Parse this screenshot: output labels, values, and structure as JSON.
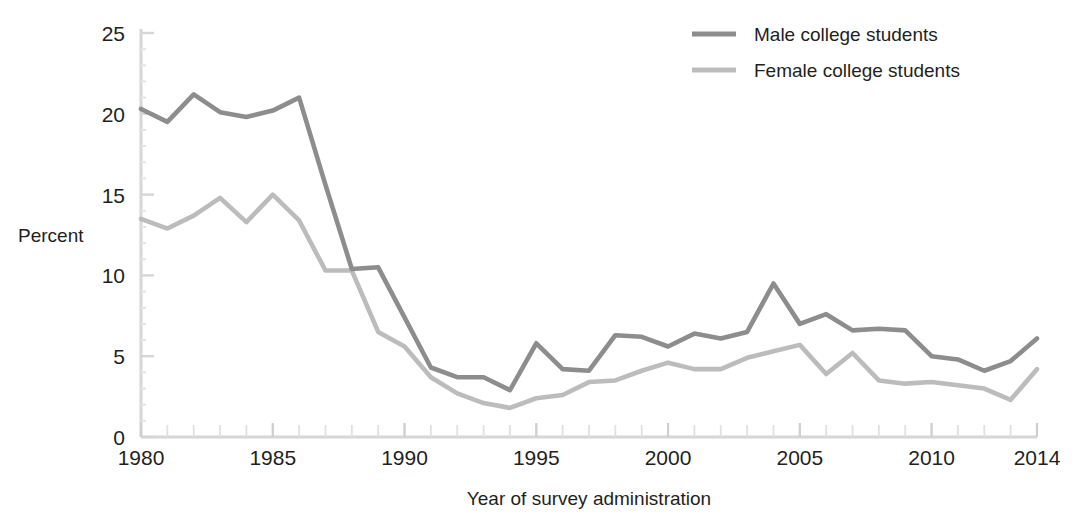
{
  "chart_data": {
    "type": "line",
    "title": "",
    "xlabel": "Year of survey administration",
    "ylabel": "Percent",
    "xlim": [
      1980,
      2014
    ],
    "ylim": [
      0,
      25
    ],
    "yticks": [
      0,
      5,
      10,
      15,
      20,
      25
    ],
    "ytick_labels": [
      "0",
      "5",
      "10",
      "15",
      "20",
      "25"
    ],
    "xticks": [
      1980,
      1985,
      1990,
      1995,
      2000,
      2005,
      2010,
      2014
    ],
    "xtick_labels": [
      "1980",
      "1985",
      "1990",
      "1995",
      "2000",
      "2005",
      "2010",
      "2014"
    ],
    "minor_xticks_every": 1,
    "grid": false,
    "legend_position": "top-right",
    "x": [
      1980,
      1981,
      1982,
      1983,
      1984,
      1985,
      1986,
      1987,
      1988,
      1989,
      1990,
      1991,
      1992,
      1993,
      1994,
      1995,
      1996,
      1997,
      1998,
      1999,
      2000,
      2001,
      2002,
      2003,
      2004,
      2005,
      2006,
      2007,
      2008,
      2009,
      2010,
      2011,
      2012,
      2013,
      2014
    ],
    "series": [
      {
        "name": "Male college students",
        "color": "#8d8d8d",
        "values": [
          20.3,
          19.5,
          21.2,
          20.1,
          19.8,
          20.2,
          21.0,
          15.6,
          10.4,
          10.5,
          7.4,
          4.3,
          3.7,
          3.7,
          2.9,
          5.8,
          4.2,
          4.1,
          6.3,
          6.2,
          5.6,
          6.4,
          6.1,
          6.5,
          9.5,
          7.0,
          7.6,
          6.6,
          6.7,
          6.6,
          5.0,
          4.8,
          4.1,
          4.7,
          6.1
        ]
      },
      {
        "name": "Female college students",
        "color": "#bcbcbc",
        "values": [
          13.5,
          12.9,
          13.7,
          14.8,
          13.3,
          15.0,
          13.4,
          10.3,
          10.3,
          6.5,
          5.6,
          3.7,
          2.7,
          2.1,
          1.8,
          2.4,
          2.6,
          3.4,
          3.5,
          4.1,
          4.6,
          4.2,
          4.2,
          4.9,
          5.3,
          5.7,
          3.9,
          5.2,
          3.5,
          3.3,
          3.4,
          3.2,
          3.0,
          2.3,
          4.2
        ]
      }
    ]
  },
  "legend": {
    "items": [
      {
        "label": "Male college students",
        "color": "#8d8d8d"
      },
      {
        "label": "Female college students",
        "color": "#bcbcbc"
      }
    ]
  },
  "axes": {
    "y_title": "Percent",
    "x_title": "Year of survey administration"
  },
  "colors": {
    "male_line": "#8d8d8d",
    "female_line": "#bcbcbc",
    "axis": "#d6d6d6",
    "text": "#231f20",
    "background": "#ffffff"
  }
}
